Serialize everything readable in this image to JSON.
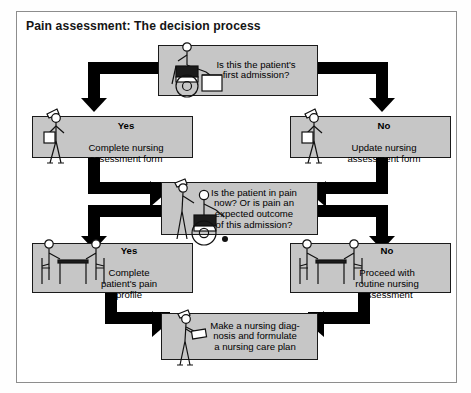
{
  "figure": {
    "title": "Pain assessment: The decision process",
    "type": "flowchart"
  },
  "nodes": {
    "q1": {
      "id": "first-admission-question",
      "text": "Is this the patient's\nfirst admission?",
      "shape": "decision",
      "illustration": "patient-in-wheelchair-at-desk"
    },
    "yes1": {
      "id": "complete-nursing-assessment",
      "label": "Yes",
      "text": "Complete nursing\nassessment form",
      "illustration": "standing-nurse-with-clipboard"
    },
    "no1": {
      "id": "update-nursing-assessment",
      "label": "No",
      "text": "Update nursing\nassessment form",
      "illustration": "standing-nurse-with-clipboard"
    },
    "q2": {
      "id": "pain-now-question",
      "text": "Is the patient in pain\nnow? Or is pain an\nexpected outcome\nof this admission?",
      "shape": "decision",
      "illustration": "nurse-pushing-patient-in-wheelchair"
    },
    "yes2": {
      "id": "complete-pain-profile",
      "label": "Yes",
      "text": "Complete\npatient's pain\nprofile",
      "illustration": "nurse-and-patient-at-table"
    },
    "no2": {
      "id": "routine-nursing-assessment",
      "label": "No",
      "text": "Proceed with\nroutine nursing\nassessment",
      "illustration": "nurse-and-patient-at-table"
    },
    "final": {
      "id": "nursing-diagnosis-care-plan",
      "text": "Make a nursing diag-\nnosis and formulate\na nursing care plan",
      "illustration": "nurse-writing-on-chart"
    }
  },
  "colors": {
    "box_fill": "#c6c6c6",
    "box_border": "#1a1a1a",
    "arrow": "#000000",
    "frame": "#8d8d8d",
    "background": "#ffffff",
    "text": "#000000"
  }
}
